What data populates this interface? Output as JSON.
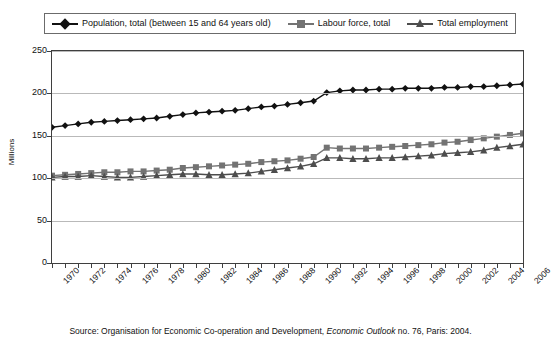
{
  "legend": {
    "position": "top",
    "entries": [
      {
        "label": "Population, total (between 15 and 64 years old)",
        "marker": "diamond-marker-icon",
        "color": "#111111"
      },
      {
        "label": "Labour force, total",
        "marker": "square-marker-icon",
        "color": "#737373"
      },
      {
        "label": "Total employment",
        "marker": "triangle-marker-icon",
        "color": "#4d4d4d"
      }
    ]
  },
  "axes": {
    "y_title": "Millions",
    "y_ticks": [
      "0",
      "50",
      "100",
      "150",
      "200",
      "250"
    ],
    "x_ticks": [
      "1970",
      "1972",
      "1974",
      "1976",
      "1978",
      "1980",
      "1982",
      "1984",
      "1986",
      "1988",
      "1990",
      "1992",
      "1994",
      "1996",
      "1998",
      "2000",
      "2002",
      "2004",
      "2006"
    ]
  },
  "source": {
    "prefix": "Source: Organisation for Economic Co-operation and Development, ",
    "italic": "Economic Outlook",
    "suffix": " no. 76, Paris: 2004."
  },
  "chart_data": {
    "type": "line",
    "title": "",
    "xlabel": "",
    "ylabel": "Millions",
    "xlim": [
      1970,
      2006
    ],
    "ylim": [
      0,
      250
    ],
    "ytick_step": 50,
    "grid": true,
    "legend_position": "top",
    "x": [
      1970,
      1971,
      1972,
      1973,
      1974,
      1975,
      1976,
      1977,
      1978,
      1979,
      1980,
      1981,
      1982,
      1983,
      1984,
      1985,
      1986,
      1987,
      1988,
      1989,
      1990,
      1991,
      1992,
      1993,
      1994,
      1995,
      1996,
      1997,
      1998,
      1999,
      2000,
      2001,
      2002,
      2003,
      2004,
      2005,
      2006
    ],
    "series": [
      {
        "name": "Population, total (between 15 and 64 years old)",
        "marker": "diamond",
        "color": "#111111",
        "values": [
          160,
          162,
          164,
          166,
          167,
          168,
          169,
          170,
          171,
          173,
          175,
          177,
          178,
          179,
          180,
          182,
          184,
          185,
          187,
          189,
          191,
          201,
          203,
          204,
          204,
          205,
          205,
          206,
          206,
          206,
          207,
          207,
          208,
          208,
          209,
          210,
          211
        ]
      },
      {
        "name": "Labour force, total",
        "marker": "square",
        "color": "#737373",
        "values": [
          103,
          104,
          105,
          106,
          107,
          107,
          108,
          108,
          109,
          110,
          112,
          113,
          114,
          115,
          116,
          117,
          119,
          120,
          121,
          123,
          125,
          136,
          135,
          135,
          135,
          136,
          137,
          138,
          139,
          140,
          142,
          143,
          145,
          147,
          149,
          151,
          153
        ]
      },
      {
        "name": "Total employment",
        "marker": "triangle",
        "color": "#4d4d4d",
        "values": [
          101,
          102,
          102,
          103,
          102,
          101,
          101,
          102,
          103,
          104,
          105,
          105,
          104,
          104,
          105,
          106,
          108,
          110,
          112,
          114,
          117,
          124,
          124,
          123,
          123,
          124,
          124,
          125,
          126,
          127,
          129,
          130,
          131,
          133,
          136,
          138,
          140
        ]
      }
    ]
  }
}
